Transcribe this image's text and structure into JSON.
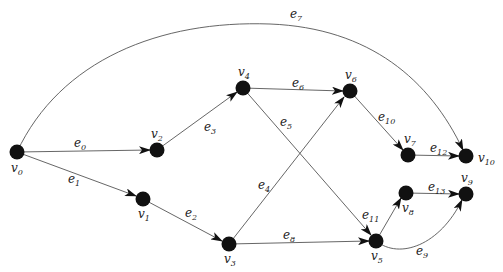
{
  "diagram": {
    "type": "directed-graph",
    "nodes": [
      {
        "id": "v0",
        "label": "v",
        "sub": "0",
        "x": 17,
        "y": 152,
        "lx": 11,
        "ly": 172
      },
      {
        "id": "v1",
        "label": "v",
        "sub": "1",
        "x": 143,
        "y": 199,
        "lx": 138,
        "ly": 218
      },
      {
        "id": "v2",
        "label": "v",
        "sub": "2",
        "x": 157,
        "y": 150,
        "lx": 151,
        "ly": 138
      },
      {
        "id": "v3",
        "label": "v",
        "sub": "3",
        "x": 229,
        "y": 244,
        "lx": 224,
        "ly": 263
      },
      {
        "id": "v4",
        "label": "v",
        "sub": "4",
        "x": 243,
        "y": 88,
        "lx": 238,
        "ly": 76
      },
      {
        "id": "v5",
        "label": "v",
        "sub": "5",
        "x": 376,
        "y": 241,
        "lx": 371,
        "ly": 260
      },
      {
        "id": "v6",
        "label": "v",
        "sub": "6",
        "x": 350,
        "y": 91,
        "lx": 345,
        "ly": 79
      },
      {
        "id": "v7",
        "label": "v",
        "sub": "7",
        "x": 408,
        "y": 155,
        "lx": 404,
        "ly": 143
      },
      {
        "id": "v8",
        "label": "v",
        "sub": "8",
        "x": 406,
        "y": 193,
        "lx": 402,
        "ly": 212
      },
      {
        "id": "v9",
        "label": "v",
        "sub": "9",
        "x": 466,
        "y": 194,
        "lx": 461,
        "ly": 182
      },
      {
        "id": "v10",
        "label": "v",
        "sub": "10",
        "x": 466,
        "y": 156,
        "lx": 478,
        "ly": 162
      }
    ],
    "edges": [
      {
        "id": "e0",
        "label": "e",
        "sub": "0",
        "from": "v0",
        "to": "v2",
        "path": "M17,152 L150,150",
        "lx": 74,
        "ly": 147
      },
      {
        "id": "e1",
        "label": "e",
        "sub": "1",
        "from": "v0",
        "to": "v1",
        "path": "M17,152 L136,196",
        "lx": 68,
        "ly": 183
      },
      {
        "id": "e2",
        "label": "e",
        "sub": "2",
        "from": "v1",
        "to": "v3",
        "path": "M143,199 L222,241",
        "lx": 185,
        "ly": 217
      },
      {
        "id": "e3",
        "label": "e",
        "sub": "3",
        "from": "v2",
        "to": "v4",
        "path": "M157,150 L237,92",
        "lx": 204,
        "ly": 131
      },
      {
        "id": "e4",
        "label": "e",
        "sub": "4",
        "from": "v3",
        "to": "v6",
        "path": "M229,244 L344,97",
        "lx": 258,
        "ly": 189
      },
      {
        "id": "e5",
        "label": "e",
        "sub": "5",
        "from": "v4",
        "to": "v5",
        "path": "M243,88 L371,235",
        "lx": 280,
        "ly": 126
      },
      {
        "id": "e6",
        "label": "e",
        "sub": "6",
        "from": "v4",
        "to": "v6",
        "path": "M243,88 L343,91",
        "lx": 292,
        "ly": 87
      },
      {
        "id": "e7",
        "label": "e",
        "sub": "7",
        "from": "v0",
        "to": "v10",
        "path": "M17,152 C60,60 160,20 270,24 C370,28 430,80 463,150",
        "lx": 290,
        "ly": 18
      },
      {
        "id": "e8",
        "label": "e",
        "sub": "8",
        "from": "v3",
        "to": "v5",
        "path": "M229,244 L369,241",
        "lx": 283,
        "ly": 239
      },
      {
        "id": "e9",
        "label": "e",
        "sub": "9",
        "from": "v5",
        "to": "v9",
        "path": "M376,241 C400,260 440,245 462,200",
        "lx": 416,
        "ly": 255
      },
      {
        "id": "e10",
        "label": "e",
        "sub": "10",
        "from": "v6",
        "to": "v7",
        "path": "M350,91 L403,150",
        "lx": 378,
        "ly": 121
      },
      {
        "id": "e11",
        "label": "e",
        "sub": "11",
        "from": "v5",
        "to": "v8",
        "path": "M376,241 L401,198",
        "lx": 362,
        "ly": 219
      },
      {
        "id": "e12",
        "label": "e",
        "sub": "12",
        "from": "v7",
        "to": "v10",
        "path": "M408,155 L459,156",
        "lx": 430,
        "ly": 152
      },
      {
        "id": "e13",
        "label": "e",
        "sub": "13",
        "from": "v8",
        "to": "v9",
        "path": "M406,193 L459,194",
        "lx": 428,
        "ly": 191
      }
    ]
  }
}
